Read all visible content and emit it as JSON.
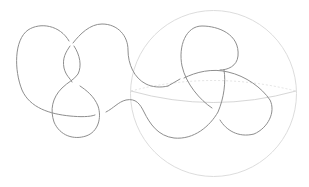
{
  "diagram": {
    "type": "knot-diagram",
    "colors": {
      "background": "#ffffff",
      "knot": "#8c8c8c",
      "sphere": "#d6d6d6",
      "equator_front": "#c8c8c8",
      "equator_back": "#dcdcdc"
    },
    "sphere": {
      "cx": 213.5,
      "cy": 93.5,
      "r": 83
    },
    "equator": {
      "cx": 213.5,
      "cy": 91,
      "rx": 83,
      "ry": 13
    }
  }
}
